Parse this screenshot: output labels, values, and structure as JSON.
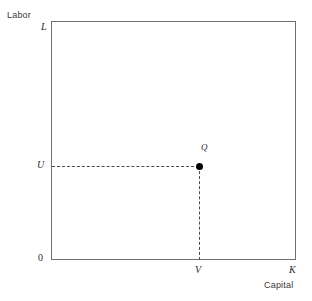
{
  "figure": {
    "axes": {
      "x_axis_name": "Capital",
      "y_axis_name": "Labor",
      "x_max_symbol": "K",
      "y_max_symbol": "L",
      "origin_symbol": "0"
    },
    "markers": {
      "point_label": "Q",
      "x_tick_symbol": "V",
      "y_tick_symbol": "U"
    },
    "colors": {
      "frame": "#707070",
      "guide": "#4a4a4a",
      "point": "#000000",
      "background": "#ffffff"
    }
  },
  "chart_data": {
    "type": "scatter",
    "title": "",
    "xlabel": "Capital",
    "ylabel": "Labor",
    "xlim": [
      0,
      1
    ],
    "ylim": [
      0,
      1
    ],
    "grid": false,
    "legend": "none",
    "x_tick_labels": [
      "0",
      "V",
      "K"
    ],
    "x_tick_values": [
      0,
      0.604,
      1
    ],
    "y_tick_labels": [
      "0",
      "U",
      "L"
    ],
    "y_tick_values": [
      0,
      0.393,
      1
    ],
    "points": [
      {
        "label": "Q",
        "x": 0.604,
        "y": 0.393,
        "x_symbol": "V",
        "y_symbol": "U"
      }
    ],
    "annotations": [
      {
        "kind": "dashed-guide",
        "orientation": "horizontal",
        "from": "U",
        "to": "Q"
      },
      {
        "kind": "dashed-guide",
        "orientation": "vertical",
        "from": "Q",
        "to": "V"
      }
    ]
  }
}
